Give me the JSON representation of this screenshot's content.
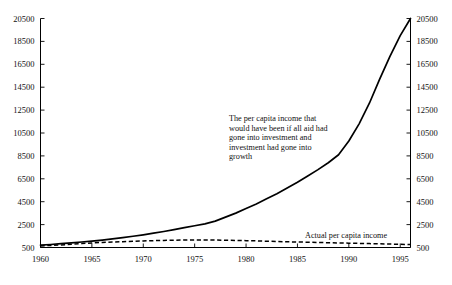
{
  "chart_data": {
    "type": "line",
    "title": "",
    "xlabel": "",
    "ylabel": "",
    "xlim": [
      1960,
      1996
    ],
    "ylim": [
      500,
      20500
    ],
    "grid": false,
    "legend": "annotations",
    "x_ticks": [
      "1960",
      "1965",
      "1970",
      "1975",
      "1980",
      "1985",
      "1990",
      "1995"
    ],
    "x_tick_values": [
      1960,
      1965,
      1970,
      1975,
      1980,
      1985,
      1990,
      1995
    ],
    "y_ticks": [
      "500",
      "2500",
      "4500",
      "6500",
      "8500",
      "10500",
      "12500",
      "14500",
      "16500",
      "18500",
      "20500"
    ],
    "y_tick_values": [
      500,
      2500,
      4500,
      6500,
      8500,
      10500,
      12500,
      14500,
      16500,
      18500,
      20500
    ],
    "right_axis_ticks": [
      "500",
      "2500",
      "4500",
      "6500",
      "8500",
      "10500",
      "12500",
      "14500",
      "16500",
      "18500",
      "20500"
    ],
    "x": [
      1960,
      1961,
      1962,
      1963,
      1964,
      1965,
      1966,
      1967,
      1968,
      1969,
      1970,
      1971,
      1972,
      1973,
      1974,
      1975,
      1976,
      1977,
      1978,
      1979,
      1980,
      1981,
      1982,
      1983,
      1984,
      1985,
      1986,
      1987,
      1988,
      1989,
      1990,
      1991,
      1992,
      1993,
      1994,
      1995,
      1996
    ],
    "series": [
      {
        "name": "The per capita income that would have been if all aid had gone into investment and investment had gone into growth",
        "style": "solid",
        "values": [
          700,
          760,
          830,
          900,
          980,
          1060,
          1150,
          1250,
          1360,
          1480,
          1610,
          1750,
          1900,
          2060,
          2230,
          2400,
          2560,
          2800,
          3150,
          3500,
          3900,
          4300,
          4750,
          5200,
          5700,
          6200,
          6750,
          7300,
          7900,
          8600,
          9800,
          11300,
          13100,
          15200,
          17200,
          19000,
          20500
        ]
      },
      {
        "name": "Actual per capita income",
        "style": "dashed",
        "values": [
          640,
          680,
          720,
          780,
          840,
          900,
          940,
          980,
          1010,
          1040,
          1070,
          1100,
          1120,
          1140,
          1150,
          1160,
          1160,
          1150,
          1140,
          1120,
          1100,
          1080,
          1050,
          1020,
          1000,
          980,
          960,
          940,
          920,
          900,
          880,
          860,
          840,
          820,
          800,
          780,
          760
        ]
      }
    ],
    "annotations": [
      {
        "id": "hypothetical-label",
        "text": "The per capita income that would have been if all aid had gone into investment and investment had gone into growth",
        "lines": [
          "The per capita income that",
          "would have been if all aid had",
          "gone into investment and",
          "investment had gone into",
          "growth"
        ],
        "x": 229,
        "y": 121
      },
      {
        "id": "actual-label",
        "text": "Actual per capita income",
        "lines": [
          "Actual per capita income"
        ],
        "x": 305,
        "y": 238
      }
    ],
    "colors": {
      "line": "#000000",
      "axis": "#000000",
      "background": "#ffffff",
      "text": "#111111"
    }
  }
}
